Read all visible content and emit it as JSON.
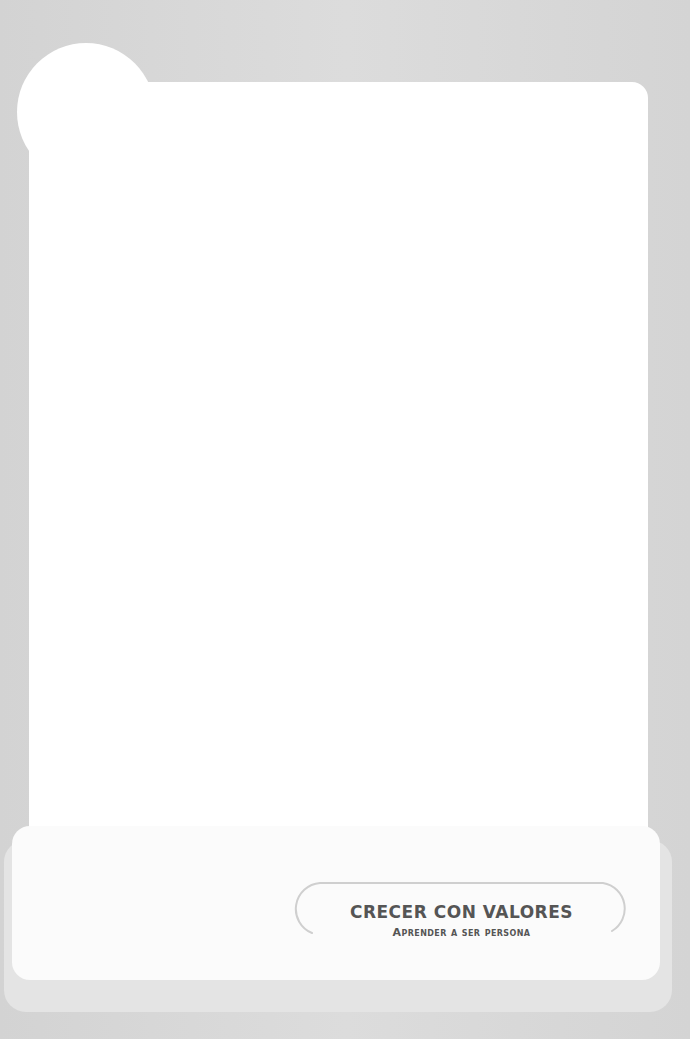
{
  "cover": {
    "title": "CRECER CON VALORES",
    "subtitle": "Aprender a ser persona"
  },
  "colors": {
    "background": "#d6d6d6",
    "panel": "#ffffff",
    "text": "#555555",
    "pill_outline": "#cccccc"
  }
}
